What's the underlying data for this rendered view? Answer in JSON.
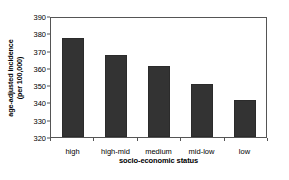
{
  "chart_data": {
    "type": "bar",
    "title": "",
    "categories": [
      "high",
      "high-mid",
      "medium",
      "mid-low",
      "low"
    ],
    "values": [
      378,
      368.5,
      362,
      351,
      342
    ],
    "series": [
      {
        "name": "age-adjusted incidence",
        "values": [
          378,
          368.5,
          362,
          351,
          342
        ]
      }
    ],
    "xlabel": "socio-economic status",
    "ylabel": "age-adjusted incidence (per 100,000)",
    "ylabel_line1": "age-adjusted incidence",
    "ylabel_line2": "(per 100,000)",
    "ylim": [
      320,
      390
    ],
    "ytick_values": [
      390,
      380,
      370,
      360,
      350,
      340,
      330,
      320
    ],
    "ytick_labels": [
      "390",
      "380",
      "370",
      "360",
      "350",
      "340",
      "330",
      "320"
    ],
    "ytick_step": 10,
    "grid": false,
    "legend": false,
    "legend_position": "none",
    "bar_color": "#333333",
    "axis_color": "#555555",
    "background_color": "#ffffff"
  }
}
